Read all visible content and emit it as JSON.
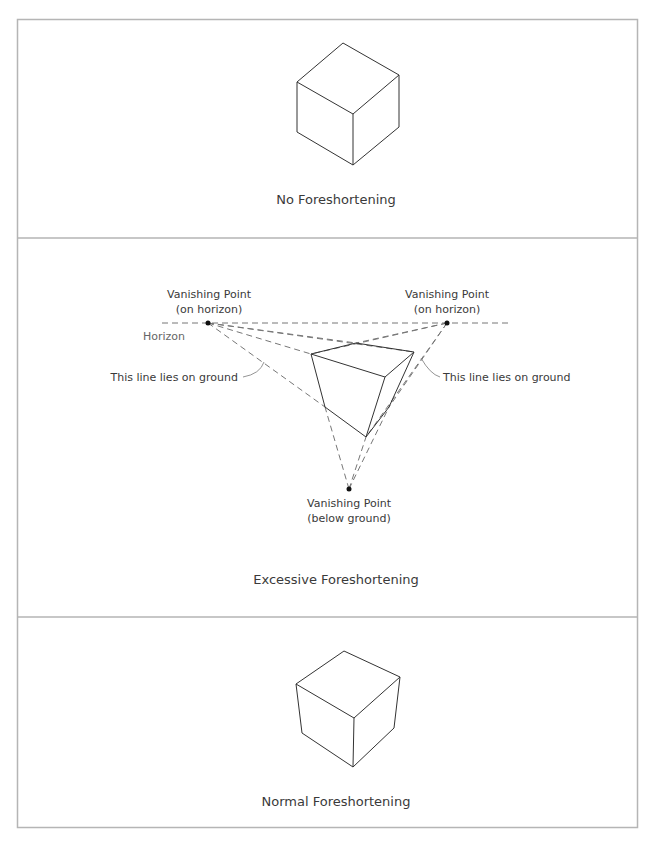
{
  "panels": [
    {
      "caption": "No Foreshortening"
    },
    {
      "caption": "Excessive Foreshortening",
      "labels": {
        "vp_left_line1": "Vanishing Point",
        "vp_left_line2": "(on horizon)",
        "vp_right_line1": "Vanishing Point",
        "vp_right_line2": "(on horizon)",
        "vp_bottom_line1": "Vanishing Point",
        "vp_bottom_line2": "(below ground)",
        "horizon": "Horizon",
        "ground_left": "This line lies on ground",
        "ground_right": "This line lies on ground"
      }
    },
    {
      "caption": "Normal Foreshortening"
    }
  ],
  "colors": {
    "frame": "#b5b5b5",
    "line": "#333333",
    "dash": "#777777"
  }
}
